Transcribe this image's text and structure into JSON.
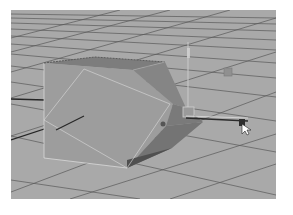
{
  "viewport": {
    "type": "3d-perspective-viewport",
    "background_color": "#a7a7a7",
    "grid_color": "#3c3c3c",
    "selection_color": "#e6e6e6"
  },
  "scene": {
    "object": "polygon-cube-with-extruded-face",
    "tool": "move-manipulator",
    "icons": [
      "move-manipulator-icon",
      "mouse-cursor-icon",
      "pivot-handle-icon",
      "axis-handle-icon"
    ]
  }
}
